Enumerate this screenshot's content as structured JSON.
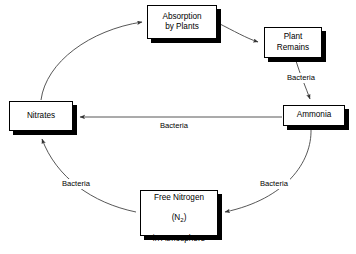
{
  "diagram": {
    "background_color": "#ffffff",
    "stroke_color": "#000000",
    "nodes": [
      {
        "id": "absorption",
        "label": "Absorption\nby Plants",
        "x": 147,
        "y": 5,
        "width": 70,
        "height": 34
      },
      {
        "id": "plant_remains",
        "label": "Plant\nRemains",
        "x": 264,
        "y": 27,
        "width": 58,
        "height": 31
      },
      {
        "id": "ammonia",
        "label": "Ammonia",
        "x": 283,
        "y": 105,
        "width": 62,
        "height": 21
      },
      {
        "id": "nitrates",
        "label": "Nitrates",
        "x": 9,
        "y": 101,
        "width": 64,
        "height": 30
      },
      {
        "id": "free_nitrogen",
        "label_line1": "Free Nitrogen",
        "label_formula": "(N",
        "label_subscript": "2",
        "label_formula_close": ")",
        "label_line3": "in Atmosphere",
        "x": 140,
        "y": 190,
        "width": 78,
        "height": 46
      }
    ],
    "edges": [
      {
        "id": "nitrates-to-absorption",
        "from": "nitrates",
        "to": "absorption",
        "label": "",
        "path": "M 41 100 C 46 62, 90 30, 142 22",
        "arrow_at": "absorption"
      },
      {
        "id": "absorption-to-plant-remains",
        "from": "absorption",
        "to": "plant_remains",
        "label": "",
        "path": "M 218 23 C 234 31, 246 38, 259 42",
        "arrow_at": "plant_remains"
      },
      {
        "id": "plant-remains-to-ammonia",
        "from": "plant_remains",
        "to": "ammonia",
        "label": "Bacteria",
        "path": "M 296 60 C 300 74, 306 88, 310 99",
        "arrow_at": "ammonia"
      },
      {
        "id": "ammonia-to-nitrates",
        "from": "ammonia",
        "to": "nitrates",
        "label": "Bacteria",
        "path": "M 282 117 L 79 117",
        "arrow_at": "nitrates"
      },
      {
        "id": "ammonia-to-free-nitrogen",
        "from": "ammonia",
        "to": "free_nitrogen",
        "label": "Bacteria",
        "path": "M 311 128 C 311 160, 286 198, 226 212",
        "arrow_at": "free_nitrogen"
      },
      {
        "id": "free-nitrogen-to-nitrates",
        "from": "free_nitrogen",
        "to": "nitrates",
        "label": "Bacteria",
        "path": "M 136 212 C 92 203, 56 177, 43 138",
        "arrow_at": "nitrates"
      }
    ],
    "labels": {
      "bacteria_plant_ammonia": "Bacteria",
      "bacteria_ammonia_nitrates": "Bacteria",
      "bacteria_ammonia_freen": "Bacteria",
      "bacteria_freen_nitrates": "Bacteria"
    }
  }
}
